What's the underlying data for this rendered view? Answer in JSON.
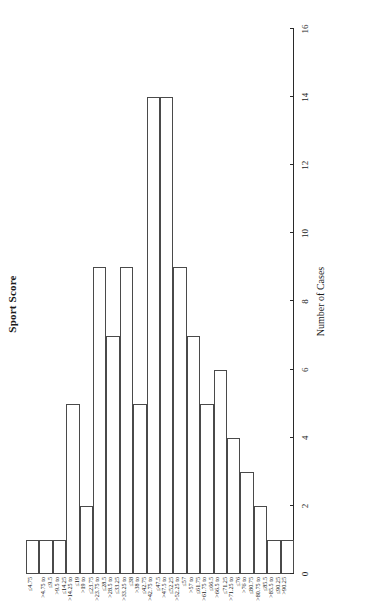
{
  "chart_title": "Sport Score",
  "value_axis": {
    "title": "Number of Cases",
    "ticks": [
      0,
      2,
      4,
      6,
      8,
      10,
      12,
      14,
      16
    ],
    "min": 0,
    "max": 16
  },
  "chart_data": {
    "type": "bar",
    "title": "Sport Score",
    "xlabel": "Sport Score",
    "ylabel": "Number of Cases",
    "ylim": [
      0,
      16
    ],
    "grid": false,
    "legend": false,
    "orientation": "horizontal-rotated",
    "categories": [
      "≤4.75",
      ">4.75 to ≤9.5",
      ">9.5 to ≤14.25",
      ">14.25 to ≤19",
      ">19 to ≤23.75",
      ">23.75 to ≤28.5",
      ">28.5 to ≤33.25",
      ">33.25 to ≤38",
      ">38 to ≤42.75",
      ">42.75 to ≤47.5",
      ">47.5 to ≤52.25",
      ">52.25 to ≤57",
      ">57 to ≤61.75",
      ">61.75 to ≤66.5",
      ">66.5 to ≤71.25",
      ">71.25 to ≤76",
      ">76 to ≤80.75",
      ">80.75 to ≤85.5",
      ">85.5 to ≤90.25",
      ">90.25"
    ],
    "category_lines": [
      [
        "≤4.75",
        ""
      ],
      [
        ">4.75 to",
        "≤9.5"
      ],
      [
        ">9.5 to",
        "≤14.25"
      ],
      [
        ">14.25 to",
        "≤19"
      ],
      [
        ">19 to",
        "≤23.75"
      ],
      [
        ">23.75 to",
        "≤28.5"
      ],
      [
        ">28.5 to",
        "≤33.25"
      ],
      [
        ">33.25 to",
        "≤38"
      ],
      [
        ">38 to",
        "≤42.75"
      ],
      [
        ">42.75 to",
        "≤47.5"
      ],
      [
        ">47.5 to",
        "≤52.25"
      ],
      [
        ">52.25 to",
        "≤57"
      ],
      [
        ">57 to",
        "≤61.75"
      ],
      [
        ">61.75 to",
        "≤66.5"
      ],
      [
        ">66.5 to",
        "≤71.25"
      ],
      [
        ">71.25 to",
        "≤76"
      ],
      [
        ">76 to",
        "≤80.75"
      ],
      [
        ">80.75 to",
        "≤85.5"
      ],
      [
        ">85.5 to",
        "≤90.25"
      ],
      [
        ">90.25",
        ""
      ]
    ],
    "values": [
      1,
      1,
      1,
      5,
      2,
      9,
      7,
      9,
      5,
      14,
      14,
      9,
      7,
      5,
      6,
      4,
      3,
      2,
      1,
      1
    ]
  },
  "colors": {
    "bar_fill": "#ffffff",
    "bar_stroke": "#4a4a4a",
    "axis": "#2a2a2a",
    "text": "#1a1a1a",
    "background": "#ffffff"
  }
}
